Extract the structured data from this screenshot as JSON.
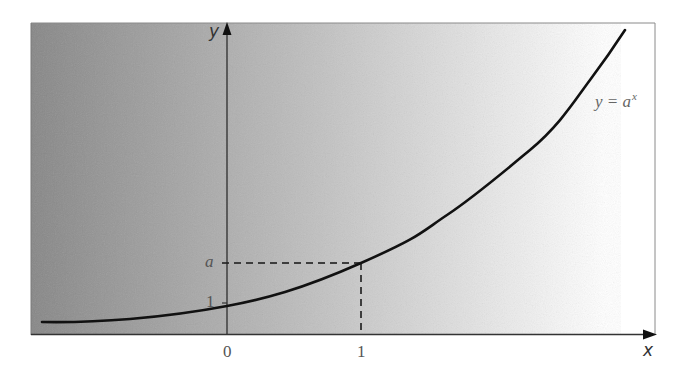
{
  "diagram": {
    "type": "function-graph",
    "background": {
      "gradient_from": "#878787",
      "gradient_mid": "#c2c2c2",
      "gradient_to": "#ffffff"
    },
    "axes": {
      "x_label": "x",
      "y_label": "y"
    },
    "ticks": {
      "x_zero": "0",
      "x_one": "1",
      "y_one": "1",
      "y_a": "a"
    },
    "curve": {
      "label_base": "y = a",
      "label_exponent": "x",
      "equation": "y = a^x",
      "color": "#111111"
    },
    "guides": {
      "style": "dashed",
      "color": "#444444",
      "description": "Dashed lines from point (1, a) to both axes"
    }
  }
}
